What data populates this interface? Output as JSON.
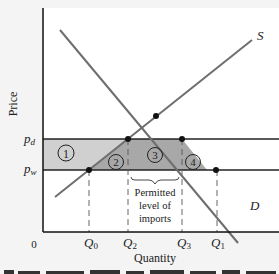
{
  "diagram": {
    "type": "supply-demand import quota diagram",
    "y_axis_label": "Price",
    "x_axis_label": "Quantity",
    "origin_label": "0",
    "price_levels": [
      {
        "label": "p",
        "sub": "d",
        "y": 139
      },
      {
        "label": "p",
        "sub": "w",
        "y": 170
      }
    ],
    "quantity_marks": [
      {
        "label": "Q",
        "sub": "0",
        "x": 89
      },
      {
        "label": "Q",
        "sub": "2",
        "x": 128
      },
      {
        "label": "Q",
        "sub": "3",
        "x": 182
      },
      {
        "label": "Q",
        "sub": "1",
        "x": 216
      }
    ],
    "curves": [
      {
        "name": "S",
        "label": "S",
        "from": [
          55,
          197
        ],
        "to": [
          252,
          40
        ]
      },
      {
        "name": "D",
        "label": "D",
        "from": [
          60,
          30
        ],
        "to": [
          238,
          243
        ]
      }
    ],
    "areas": [
      {
        "id": "1",
        "label": "1",
        "fill": "#d0d0d0"
      },
      {
        "id": "2",
        "label": "2",
        "fill": "#a8a8a8"
      },
      {
        "id": "3",
        "label": "3",
        "fill": "#a8a8a8"
      },
      {
        "id": "4",
        "label": "4",
        "fill": "#a8a8a8"
      }
    ],
    "annotation": {
      "line1": "Permitted",
      "line2": "level of",
      "line3": "imports"
    },
    "colors": {
      "curve": "#6e6e6e",
      "axis": "#111111",
      "light_fill": "#d0d0d0",
      "dark_fill": "#a8a8a8",
      "background": "#ffffff"
    }
  }
}
